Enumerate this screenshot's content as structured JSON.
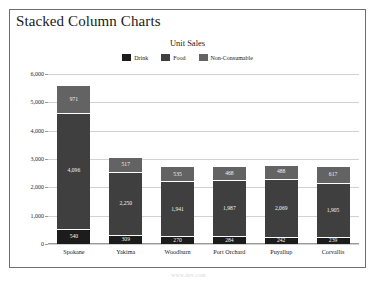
{
  "page_title": "Stacked Column Charts",
  "watermark": "www.dev.com",
  "colors": {
    "drink": "#1c1c1c",
    "food": "#3f3f3f",
    "non_consumable": "#636363",
    "grid": "#d2d2d2",
    "axis": "#9a9a9a",
    "border": "#6e6e6e",
    "background": "#ffffff"
  },
  "legend": {
    "position": "top-center",
    "entries": [
      {
        "label": "Drink",
        "color": "#1c1c1c",
        "swatch": "legend-swatch-drink"
      },
      {
        "label": "Food",
        "color": "#3f3f3f",
        "swatch": "legend-swatch-food"
      },
      {
        "label": "Non-Consumable",
        "color": "#636363",
        "swatch": "legend-swatch-non-consumable"
      }
    ]
  },
  "yaxis": {
    "ticks": [
      "6,000",
      "5,000",
      "4,000",
      "3,000",
      "2,000",
      "1,000",
      "0"
    ],
    "min": 0,
    "max": 6000,
    "step": 1000
  },
  "chart_data": {
    "type": "bar",
    "subtype": "stacked-column",
    "title": "Unit Sales",
    "xlabel": "",
    "ylabel": "",
    "ylim": [
      0,
      6000
    ],
    "grid": true,
    "legend_position": "top-center",
    "categories": [
      "Spokane",
      "Yakima",
      "Woodburn",
      "Port Orchard",
      "Puyallup",
      "Corvallis"
    ],
    "series": [
      {
        "name": "Drink",
        "color": "#1c1c1c",
        "values": [
          540,
          309,
          270,
          284,
          242,
          239
        ]
      },
      {
        "name": "Food",
        "color": "#3f3f3f",
        "values": [
          4096,
          2250,
          1941,
          1987,
          2069,
          1905
        ]
      },
      {
        "name": "Non-Consumable",
        "color": "#636363",
        "values": [
          971,
          517,
          535,
          468,
          488,
          617
        ]
      }
    ],
    "labels": {
      "Drink": [
        "540",
        "309",
        "270",
        "284",
        "242",
        "239"
      ],
      "Food": [
        "4,096",
        "2,250",
        "1,941",
        "1,987",
        "2,069",
        "1,905"
      ],
      "Non-Consumable": [
        "971",
        "517",
        "535",
        "468",
        "488",
        "617"
      ]
    },
    "totals": [
      5607,
      3076,
      2746,
      2739,
      2799,
      2761
    ]
  }
}
